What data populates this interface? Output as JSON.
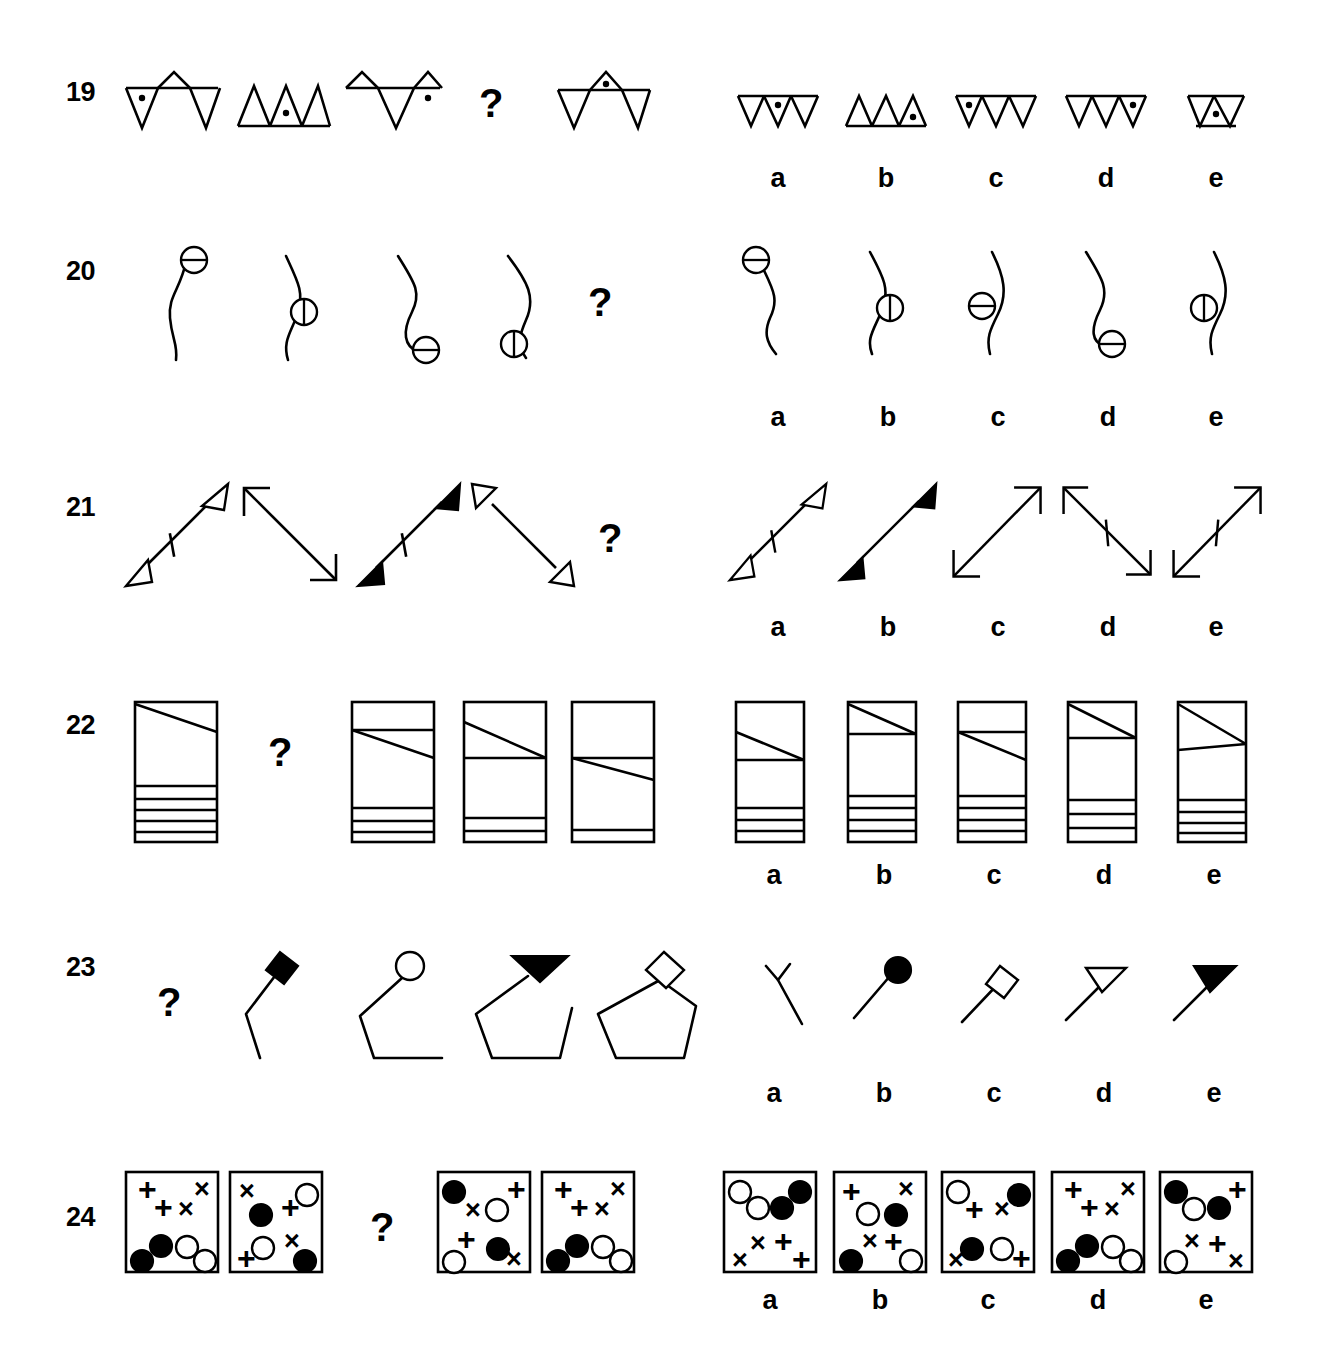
{
  "page": {
    "background_color": "#ffffff",
    "ink_color": "#000000",
    "question_mark": "?",
    "option_labels": [
      "a",
      "b",
      "c",
      "d",
      "e"
    ]
  },
  "items": [
    {
      "number": "19",
      "figure_type": "zigzag-triangle-strip-with-dot",
      "question_position": 4,
      "sequence": [
        {
          "index": 1,
          "pattern": "down-up-down zigzag, 3 triangles, baseline top",
          "dot": "triangle 1 (down)"
        },
        {
          "index": 2,
          "pattern": "up-up-up, 3 triangles, baseline bottom",
          "dot": "triangle 2 (up)"
        },
        {
          "index": 3,
          "pattern": "up-down-up zigzag, 3 triangles",
          "dot": "triangle 3 (up)"
        },
        {
          "index": 4,
          "pattern": "question mark",
          "dot": ""
        },
        {
          "index": 5,
          "pattern": "down-up-down zigzag, 3 triangles",
          "dot": "triangle 2 (up)"
        }
      ],
      "options": [
        {
          "label": "a",
          "pattern": "3 down triangles, baseline top",
          "dot": "middle triangle"
        },
        {
          "label": "b",
          "pattern": "3 up triangles, baseline bottom",
          "dot": "third triangle"
        },
        {
          "label": "c",
          "pattern": "3 down triangles, baseline top",
          "dot": "first triangle"
        },
        {
          "label": "d",
          "pattern": "3 down triangles, baseline top",
          "dot": "third triangle"
        },
        {
          "label": "e",
          "pattern": "2 triangles (down, up) narrow, baseline top and bottom",
          "dot": "second triangle"
        }
      ]
    },
    {
      "number": "20",
      "figure_type": "s-curve-with-divided-circle",
      "question_position": 5,
      "sequence": [
        {
          "index": 1,
          "pattern": "S-curve, circle at top end, horizontal divider"
        },
        {
          "index": 2,
          "pattern": "S-curve, circle at middle right, vertical divider"
        },
        {
          "index": 3,
          "pattern": "S-curve, circle at bottom end, horizontal divider"
        },
        {
          "index": 4,
          "pattern": "S-curve, circle at bottom left, vertical divider"
        },
        {
          "index": 5,
          "pattern": "question mark"
        }
      ],
      "options": [
        {
          "label": "a",
          "pattern": "S-curve, circle at top-left end, horizontal divider"
        },
        {
          "label": "b",
          "pattern": "S-curve, circle mid-right, vertical divider"
        },
        {
          "label": "c",
          "pattern": "S-curve, circle mid-left, horizontal divider"
        },
        {
          "label": "d",
          "pattern": "S-curve, circle at bottom, horizontal divider"
        },
        {
          "label": "e",
          "pattern": "S-curve, circle mid-left, vertical divider"
        }
      ]
    },
    {
      "number": "21",
      "figure_type": "double-headed-diagonal-arrow",
      "question_position": 5,
      "sequence": [
        {
          "index": 1,
          "pattern": "SW-NE arrow, both heads hollow, tick mark on shaft"
        },
        {
          "index": 2,
          "pattern": "NW-SE arrow, both heads open line, no tick"
        },
        {
          "index": 3,
          "pattern": "SW-NE arrow, both heads solid filled, tick mark on shaft"
        },
        {
          "index": 4,
          "pattern": "NW-SE arrow, both heads hollow, no tick"
        },
        {
          "index": 5,
          "pattern": "question mark"
        }
      ],
      "options": [
        {
          "label": "a",
          "pattern": "SW-NE arrow, hollow heads, tick mark"
        },
        {
          "label": "b",
          "pattern": "SW-NE arrow, solid heads, no tick"
        },
        {
          "label": "c",
          "pattern": "SW-NE arrow, open line heads, no tick"
        },
        {
          "label": "d",
          "pattern": "NW-SE arrow, open line heads, tick mark"
        },
        {
          "label": "e",
          "pattern": "SW-NE arrow, open line heads, tick mark"
        }
      ]
    },
    {
      "number": "22",
      "figure_type": "rectangle-with-diagonal-and-stripes",
      "question_position": 2,
      "sequence": [
        {
          "index": 1,
          "pattern": "tall rectangle; diagonal from top-left down to right; 5 horizontal stripes at bottom"
        },
        {
          "index": 2,
          "pattern": "question mark"
        },
        {
          "index": 3,
          "pattern": "rectangle; horizontal line near top, diagonal below it; 3 stripes at bottom"
        },
        {
          "index": 4,
          "pattern": "rectangle; diagonal from upper-left to mid-right meeting horizontal line; 2 stripes at bottom"
        },
        {
          "index": 5,
          "pattern": "rectangle; horizontal line at 1/3, diagonal below going down-right; 1 stripe at bottom"
        }
      ],
      "options": [
        {
          "label": "a",
          "pattern": "horizontal line at upper third, diagonal beneath, 3 bottom stripes"
        },
        {
          "label": "b",
          "pattern": "diagonal from top-left to horizontal line near top, 4 bottom stripes"
        },
        {
          "label": "c",
          "pattern": "horizontal line near top, diagonal below sloping down-right, 4 bottom stripes"
        },
        {
          "label": "d",
          "pattern": "diagonal from top-left meeting horizontal line, 3 bottom stripes"
        },
        {
          "label": "e",
          "pattern": "two diagonals forming wedge at top-right, 4 bottom stripes"
        }
      ]
    },
    {
      "number": "23",
      "figure_type": "growing-polyline-with-terminal-shape",
      "question_position": 1,
      "sequence": [
        {
          "index": 1,
          "pattern": "question mark"
        },
        {
          "index": 2,
          "pattern": "2-segment polyline, solid diamond at top end"
        },
        {
          "index": 3,
          "pattern": "3-segment polyline, hollow circle at top end"
        },
        {
          "index": 4,
          "pattern": "4-segment polyline, solid triangle at top end"
        },
        {
          "index": 5,
          "pattern": "5-segment closed pentagon, hollow diamond at apex"
        }
      ],
      "options": [
        {
          "label": "a",
          "pattern": "bent line with small Y fork at top"
        },
        {
          "label": "b",
          "pattern": "single diagonal line with solid circle at top end"
        },
        {
          "label": "c",
          "pattern": "single diagonal line with hollow diamond at top end"
        },
        {
          "label": "d",
          "pattern": "single diagonal line with hollow triangle at top end"
        },
        {
          "label": "e",
          "pattern": "single diagonal line with solid triangle at top end"
        }
      ]
    },
    {
      "number": "24",
      "figure_type": "square-box-with-scattered-symbols",
      "question_position": 3,
      "symbol_legend": {
        "plus": "+",
        "cross": "×",
        "filled_circle": "●",
        "hollow_circle": "○"
      },
      "sequence": [
        {
          "index": 1,
          "symbols": [
            "+",
            "+",
            "×",
            "×",
            "●",
            "●",
            "○",
            "○"
          ],
          "pattern": "plus pair upper-left, cross pair upper-right, filled circles lower-left, hollow circles lower-right"
        },
        {
          "index": 2,
          "symbols": [
            "×",
            "●",
            "+",
            "○",
            "○",
            "×",
            "+",
            "●"
          ],
          "pattern": "mixed quadrants"
        },
        {
          "index": 3,
          "pattern": "question mark"
        },
        {
          "index": 4,
          "symbols": [
            "●",
            "×",
            "○",
            "+",
            "+",
            "●",
            "○",
            "×"
          ],
          "pattern": "mixed quadrants"
        },
        {
          "index": 5,
          "symbols": [
            "+",
            "+",
            "×",
            "×",
            "●",
            "●",
            "○",
            "○"
          ],
          "pattern": "plus pair upper-left, cross pair upper-right, filled circles lower-left, hollow circles lower-right"
        }
      ],
      "options": [
        {
          "label": "a",
          "symbols": [
            "○",
            "○",
            "●",
            "●",
            "×",
            "×",
            "+",
            "+"
          ],
          "pattern": "hollow circles upper-left, filled circles upper-right, crosses lower-left, pluses lower-right"
        },
        {
          "label": "b",
          "symbols": [
            "+",
            "○",
            "×",
            "●",
            "×",
            "●",
            "+",
            "○"
          ],
          "pattern": "mixed quadrants"
        },
        {
          "label": "c",
          "symbols": [
            "○",
            "+",
            "×",
            "●",
            "●",
            "○",
            "×",
            "+"
          ],
          "pattern": "mixed quadrants"
        },
        {
          "label": "d",
          "symbols": [
            "+",
            "+",
            "×",
            "×",
            "●",
            "●",
            "○",
            "○"
          ],
          "pattern": "plus pair upper-left, cross pair upper-right, filled circles lower-left, hollow circles lower-right"
        },
        {
          "label": "e",
          "symbols": [
            "●",
            "○",
            "●",
            "+",
            "○",
            "×",
            "+",
            "×"
          ],
          "pattern": "mixed quadrants"
        }
      ]
    }
  ]
}
